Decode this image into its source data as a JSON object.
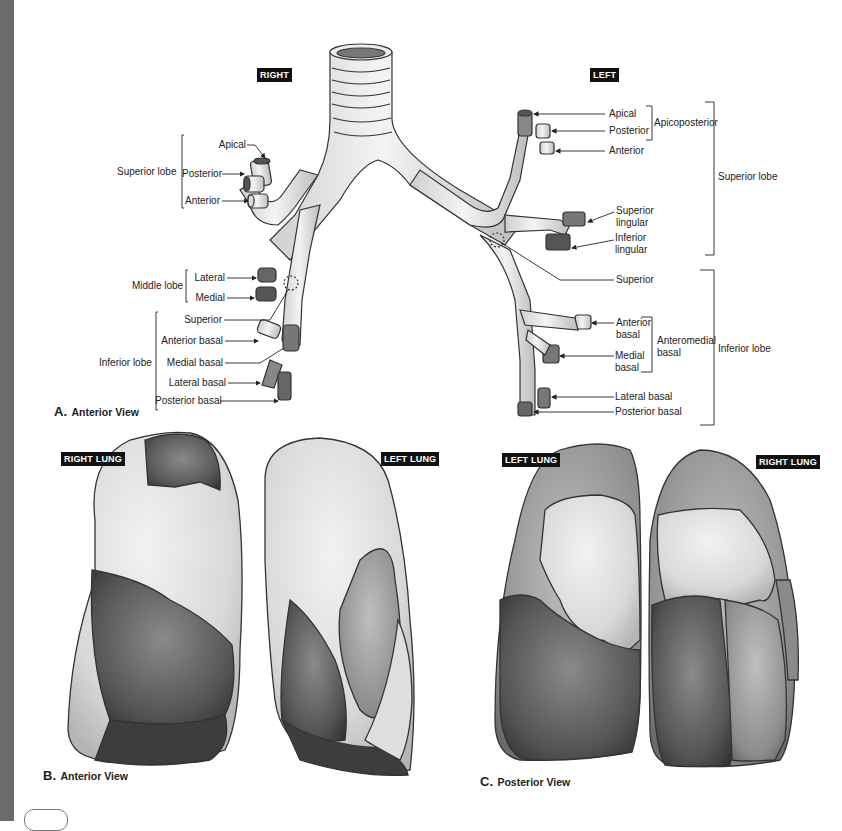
{
  "figure": {
    "panel_a": {
      "caption_letter": "A.",
      "caption_text": "Anterior View",
      "side_tags": {
        "right": "RIGHT",
        "left": "LEFT"
      },
      "right": {
        "groups": [
          {
            "name": "Superior lobe",
            "segments": [
              "Apical",
              "Posterior",
              "Anterior"
            ]
          },
          {
            "name": "Middle lobe",
            "segments": [
              "Lateral",
              "Medial"
            ]
          },
          {
            "name": "Inferior lobe",
            "segments": [
              "Superior",
              "Anterior basal",
              "Medial basal",
              "Lateral basal",
              "Posterior basal"
            ]
          }
        ]
      },
      "left": {
        "subgroups": [
          {
            "name": "Apicoposterior",
            "segments": [
              "Apical",
              "Posterior"
            ]
          },
          {
            "name": "Anteromedial basal",
            "name_lines": [
              "Anteromedial",
              "basal"
            ],
            "segments": [
              "Anterior basal",
              "Medial basal"
            ]
          }
        ],
        "groups": [
          {
            "name": "Superior lobe",
            "segments": [
              "Apical",
              "Posterior",
              "Anterior",
              "Superior lingular",
              "Inferior lingular"
            ]
          },
          {
            "name": "Inferior lobe",
            "segments": [
              "Superior",
              "Anterior basal",
              "Medial basal",
              "Lateral basal",
              "Posterior basal"
            ]
          }
        ],
        "segment_labels": {
          "apical": "Apical",
          "posterior": "Posterior",
          "anterior": "Anterior",
          "superior_lingular_1": "Superior",
          "superior_lingular_2": "lingular",
          "inferior_lingular_1": "Inferior",
          "inferior_lingular_2": "lingular",
          "superior": "Superior",
          "anterior_basal_1": "Anterior",
          "anterior_basal_2": "basal",
          "medial_basal_1": "Medial",
          "medial_basal_2": "basal",
          "lateral_basal": "Lateral basal",
          "posterior_basal": "Posterior basal",
          "apicoposterior": "Apicoposterior",
          "anteromedial_1": "Anteromedial",
          "anteromedial_2": "basal",
          "superior_lobe": "Superior lobe",
          "inferior_lobe": "Inferior lobe"
        }
      }
    },
    "panel_b": {
      "caption_letter": "B.",
      "caption_text": "Anterior View",
      "tags": [
        "RIGHT LUNG",
        "LEFT LUNG"
      ]
    },
    "panel_c": {
      "caption_letter": "C.",
      "caption_text": "Posterior View",
      "tags": [
        "LEFT LUNG",
        "RIGHT LUNG"
      ]
    }
  },
  "colors": {
    "page_edge": "#6b6b6b",
    "tag_bg": "#111111",
    "tag_text": "#ffffff",
    "label_text": "#222222",
    "outline": "#333333"
  }
}
